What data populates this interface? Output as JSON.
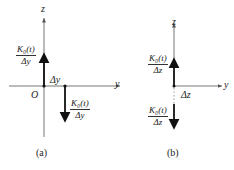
{
  "figure": {
    "panel_a": {
      "axis_z_label": "z",
      "axis_y_label": "y",
      "origin_label": "O",
      "offset_label": "Δy",
      "upper_fraction": {
        "numerator": "K₀(t)",
        "denominator": "Δy"
      },
      "lower_fraction": {
        "numerator": "K₀(t)",
        "denominator": "Δy"
      },
      "caption": "(a)"
    },
    "panel_b": {
      "axis_z_label": "z",
      "axis_y_label": "y",
      "offset_label": "Δz",
      "upper_fraction": {
        "numerator": "K₀(t)",
        "denominator": "Δz"
      },
      "lower_fraction": {
        "numerator": "K₀(t)",
        "denominator": "Δz"
      },
      "caption": "(b)"
    },
    "colors": {
      "ink": "#222222",
      "axis": "#555555"
    }
  }
}
